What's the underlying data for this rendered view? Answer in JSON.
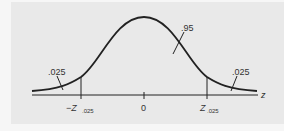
{
  "figure": {
    "type": "standard-normal-distribution",
    "axis_label": "z",
    "center_label": "0",
    "left_critical_label": "−Z",
    "left_critical_subscript": ".025",
    "right_critical_label": "Z",
    "right_critical_subscript": ".025",
    "center_area_label": ".95",
    "left_tail_area_label": ".025",
    "right_tail_area_label": ".025"
  },
  "colors": {
    "panel_background": "#e9e9e9",
    "page_background": "#f6f6f6",
    "curve": "#222222",
    "text": "#333333"
  }
}
